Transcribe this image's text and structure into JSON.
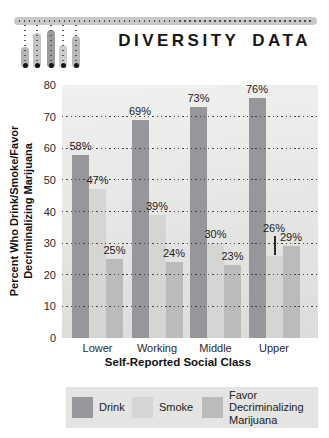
{
  "header": {
    "title": "DIVERSITY DATA"
  },
  "chart_data": {
    "type": "bar",
    "categories": [
      "Lower",
      "Working",
      "Middle",
      "Upper"
    ],
    "series": [
      {
        "name": "Drink",
        "color": "#97979b",
        "values": [
          58,
          69,
          73,
          76
        ]
      },
      {
        "name": "Smoke",
        "color": "#d5d5d3",
        "values": [
          47,
          39,
          30,
          26
        ]
      },
      {
        "name": "Favor Decriminalizing Marijuana",
        "color": "#bbbbb9",
        "values": [
          25,
          24,
          23,
          29
        ]
      }
    ],
    "value_label_suffix": "%",
    "xlabel": "Self-Reported Social Class",
    "ylabel": "Percent Who Drink/Smoke/Favor\nDecriminalizing Marijuana",
    "ylim": [
      0,
      80
    ],
    "yticks": [
      0,
      10,
      20,
      30,
      40,
      50,
      60,
      70,
      80
    ],
    "gridlines": [
      10,
      20,
      30,
      40,
      50,
      60,
      70
    ],
    "grid_style": "dotted",
    "annotations": [
      {
        "category": "Upper",
        "series": "Smoke",
        "leader_line": true
      }
    ],
    "legend": {
      "position": "bottom",
      "items": [
        {
          "label": "Drink",
          "color": "#97979b"
        },
        {
          "label": "Smoke",
          "color": "#d5d5d3"
        },
        {
          "label": "Favor\nDecriminalizing\nMarijuana",
          "color": "#bbbbb9"
        }
      ]
    }
  }
}
